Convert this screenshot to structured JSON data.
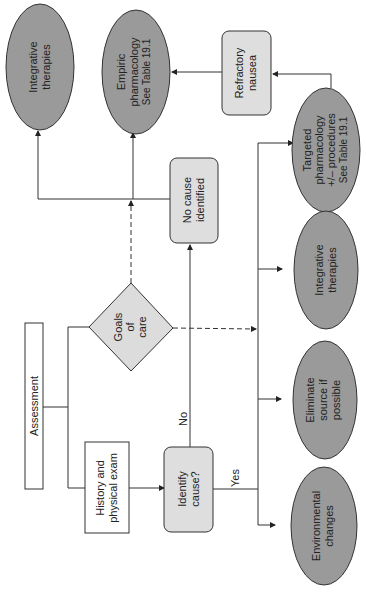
{
  "diagram": {
    "orientation": "rotated 90deg counter-clockwise",
    "colors": {
      "ellipse_fill": "#9a9a9a",
      "rounded_box_fill": "#dedede",
      "diamond_fill": "#dcdcdc",
      "plain_box_fill": "#ffffff",
      "stroke": "#333333"
    },
    "nodes": {
      "assessment": {
        "line1": "Assessment"
      },
      "history": {
        "line1": "History and",
        "line2": "physical exam"
      },
      "goals": {
        "line1": "Goals",
        "line2": "of",
        "line3": "care"
      },
      "identify": {
        "line1": "Identify",
        "line2": "cause?"
      },
      "no_cause": {
        "line1": "No cause",
        "line2": "identified"
      },
      "refractory": {
        "line1": "Refractory",
        "line2": "nausea"
      },
      "integrative_top": {
        "line1": "Integrative",
        "line2": "therapies"
      },
      "empiric": {
        "line1": "Empiric",
        "line2": "pharmacology",
        "line3": "See Table 19.1"
      },
      "environmental": {
        "line1": "Environmental",
        "line2": "changes"
      },
      "eliminate": {
        "line1": "Eliminate",
        "line2": "source if",
        "line3": "possible"
      },
      "integrative_right": {
        "line1": "Integrative",
        "line2": "therapies"
      },
      "targeted": {
        "line1": "Targeted",
        "line2": "pharmacology",
        "line3": "+/– procedures",
        "line4": "See Table 19.1"
      }
    },
    "edge_labels": {
      "no": "No",
      "yes": "Yes"
    }
  }
}
